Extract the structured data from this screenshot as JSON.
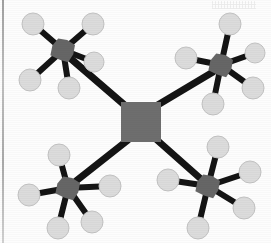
{
  "figure": {
    "kind": "molecular-network-diagram",
    "width": 271,
    "height": 243,
    "background_color": "#fdfdfd",
    "border_color": "#9a9a9a",
    "bond_color": "#141414",
    "core_node_color": "#6e6e6e",
    "branch_node_color": "#6a6a6a",
    "satellite_color": "#dcdcdc",
    "satellite_stroke": "#c2c2c2"
  },
  "nodes": {
    "center": {
      "label": "center-core",
      "shape": "square",
      "x": 141,
      "y": 122,
      "size": 40,
      "color": "#6e6e6e"
    },
    "branches": [
      {
        "label": "branch-top-left",
        "shape": "polygon",
        "x": 63,
        "y": 50,
        "size": 26,
        "color": "#666666"
      },
      {
        "label": "branch-top-right",
        "shape": "polygon",
        "x": 221,
        "y": 65,
        "size": 26,
        "color": "#666666"
      },
      {
        "label": "branch-bottom-left",
        "shape": "polygon",
        "x": 68,
        "y": 188,
        "size": 26,
        "color": "#666666"
      },
      {
        "label": "branch-bottom-right",
        "shape": "polygon",
        "x": 208,
        "y": 186,
        "size": 26,
        "color": "#666666"
      }
    ]
  },
  "core_bonds": [
    {
      "label": "bond-center-to-top-left",
      "x1": 128,
      "y1": 108,
      "x2": 70,
      "y2": 58,
      "width": 7
    },
    {
      "label": "bond-center-to-top-right",
      "x1": 156,
      "y1": 106,
      "x2": 213,
      "y2": 72,
      "width": 7
    },
    {
      "label": "bond-center-to-bottom-left",
      "x1": 128,
      "y1": 140,
      "x2": 76,
      "y2": 181,
      "width": 7
    },
    {
      "label": "bond-center-to-bottom-right",
      "x1": 157,
      "y1": 140,
      "x2": 201,
      "y2": 179,
      "width": 7
    }
  ],
  "satellites": [
    {
      "group": "top-left",
      "label": "satellite-tl-1",
      "cx": 33,
      "cy": 24,
      "r": 11,
      "bond_width": 6
    },
    {
      "group": "top-left",
      "label": "satellite-tl-2",
      "cx": 93,
      "cy": 24,
      "r": 11,
      "bond_width": 6
    },
    {
      "group": "top-left",
      "label": "satellite-tl-3",
      "cx": 94,
      "cy": 62,
      "r": 10,
      "bond_width": 6
    },
    {
      "group": "top-left",
      "label": "satellite-tl-4",
      "cx": 30,
      "cy": 80,
      "r": 11,
      "bond_width": 6
    },
    {
      "group": "top-left",
      "label": "satellite-tl-5",
      "cx": 69,
      "cy": 88,
      "r": 11,
      "bond_width": 6
    },
    {
      "group": "top-right",
      "label": "satellite-tr-1",
      "cx": 230,
      "cy": 24,
      "r": 11,
      "bond_width": 6
    },
    {
      "group": "top-right",
      "label": "satellite-tr-2",
      "cx": 186,
      "cy": 58,
      "r": 11,
      "bond_width": 6
    },
    {
      "group": "top-right",
      "label": "satellite-tr-3",
      "cx": 255,
      "cy": 53,
      "r": 10,
      "bond_width": 6
    },
    {
      "group": "top-right",
      "label": "satellite-tr-4",
      "cx": 253,
      "cy": 88,
      "r": 11,
      "bond_width": 6
    },
    {
      "group": "top-right",
      "label": "satellite-tr-5",
      "cx": 213,
      "cy": 104,
      "r": 11,
      "bond_width": 6
    },
    {
      "group": "bottom-left",
      "label": "satellite-bl-1",
      "cx": 59,
      "cy": 155,
      "r": 11,
      "bond_width": 6
    },
    {
      "group": "bottom-left",
      "label": "satellite-bl-2",
      "cx": 29,
      "cy": 195,
      "r": 11,
      "bond_width": 6
    },
    {
      "group": "bottom-left",
      "label": "satellite-bl-3",
      "cx": 110,
      "cy": 186,
      "r": 11,
      "bond_width": 6
    },
    {
      "group": "bottom-left",
      "label": "satellite-bl-4",
      "cx": 58,
      "cy": 228,
      "r": 11,
      "bond_width": 6
    },
    {
      "group": "bottom-left",
      "label": "satellite-bl-5",
      "cx": 92,
      "cy": 222,
      "r": 11,
      "bond_width": 6
    },
    {
      "group": "bottom-right",
      "label": "satellite-br-1",
      "cx": 218,
      "cy": 147,
      "r": 11,
      "bond_width": 6
    },
    {
      "group": "bottom-right",
      "label": "satellite-br-2",
      "cx": 168,
      "cy": 180,
      "r": 11,
      "bond_width": 6
    },
    {
      "group": "bottom-right",
      "label": "satellite-br-3",
      "cx": 250,
      "cy": 172,
      "r": 11,
      "bond_width": 6
    },
    {
      "group": "bottom-right",
      "label": "satellite-br-4",
      "cx": 244,
      "cy": 208,
      "r": 11,
      "bond_width": 6
    },
    {
      "group": "bottom-right",
      "label": "satellite-br-5",
      "cx": 198,
      "cy": 228,
      "r": 11,
      "bond_width": 6
    }
  ]
}
